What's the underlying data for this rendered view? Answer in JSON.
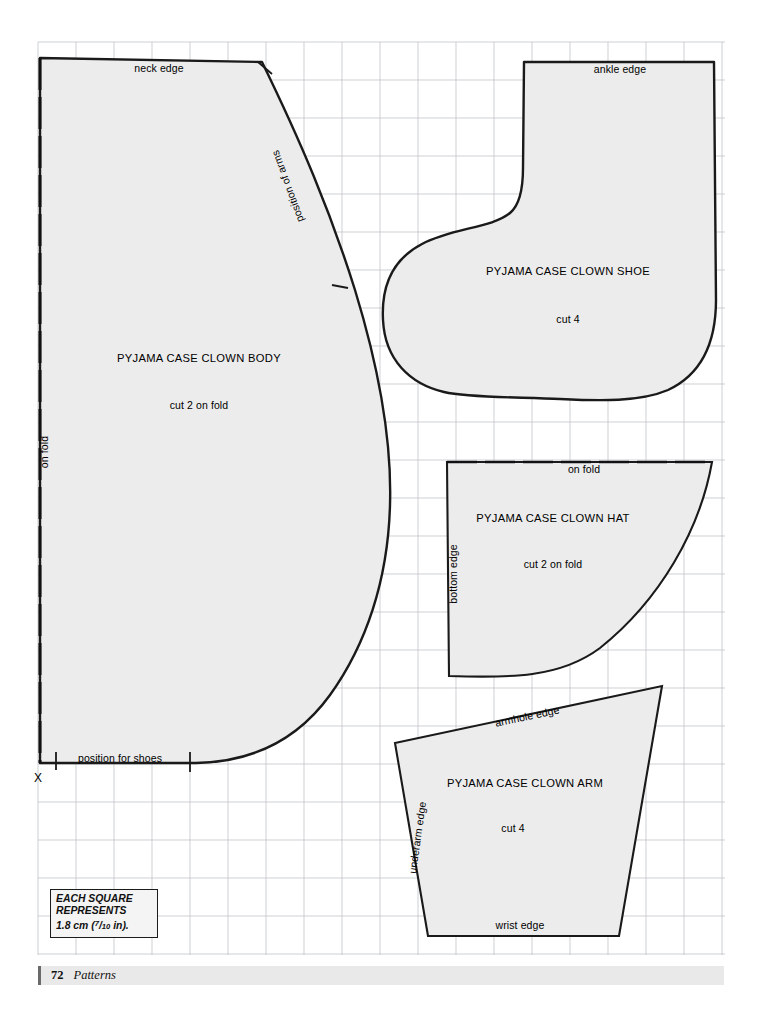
{
  "document": {
    "page_number": "72",
    "section": "Patterns"
  },
  "legend": {
    "line1": "EACH SQUARE",
    "line2": "REPRESENTS",
    "value_prefix": "1.8 cm (",
    "frac_num": "7",
    "frac_den": "10",
    "value_suffix": " in)."
  },
  "grid": {
    "cell_px": 38,
    "left": 38,
    "top": 42,
    "right": 725,
    "bottom": 955,
    "line_color": "#b9bcc2",
    "fill_color": "#ececec",
    "ink_color": "#1a1a1a"
  },
  "pieces": [
    {
      "id": "body",
      "title": "PYJAMA CASE CLOWN  BODY",
      "cut": "cut 2 on fold",
      "edges": [
        {
          "name": "neck-edge",
          "label": "neck edge"
        },
        {
          "name": "position-of-arms",
          "label": "position of arms"
        },
        {
          "name": "on-fold",
          "label": "on fold"
        },
        {
          "name": "position-for-shoes",
          "label": "position for shoes"
        }
      ],
      "marker": "X"
    },
    {
      "id": "shoe",
      "title": "PYJAMA CASE CLOWN  SHOE",
      "cut": "cut 4",
      "edges": [
        {
          "name": "ankle-edge",
          "label": "ankle edge"
        }
      ]
    },
    {
      "id": "hat",
      "title": "PYJAMA CASE CLOWN  HAT",
      "cut": "cut 2 on fold",
      "edges": [
        {
          "name": "on-fold",
          "label": "on fold"
        },
        {
          "name": "bottom-edge",
          "label": "bottom edge"
        }
      ]
    },
    {
      "id": "arm",
      "title": "PYJAMA CASE CLOWN  ARM",
      "cut": "cut 4",
      "edges": [
        {
          "name": "armhole-edge",
          "label": "armhole edge"
        },
        {
          "name": "underarm-edge",
          "label": "underarm edge"
        },
        {
          "name": "wrist-edge",
          "label": "wrist edge"
        }
      ]
    }
  ]
}
